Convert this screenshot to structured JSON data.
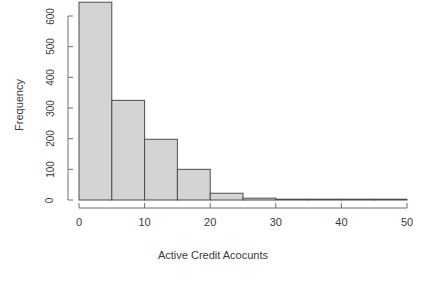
{
  "chart_data": {
    "type": "bar",
    "title": "",
    "xlabel": "Active Credit Acocunts",
    "ylabel": "Frequency",
    "bin_width": 5,
    "categories": [
      "0-5",
      "5-10",
      "10-15",
      "15-20",
      "20-25",
      "25-30",
      "30-35",
      "35-40",
      "40-45",
      "45-50"
    ],
    "bin_starts": [
      0,
      5,
      10,
      15,
      20,
      25,
      30,
      35,
      40,
      45
    ],
    "bin_ends": [
      5,
      10,
      15,
      20,
      25,
      30,
      35,
      40,
      45,
      50
    ],
    "values": [
      645,
      325,
      198,
      100,
      22,
      6,
      2,
      1,
      0,
      0
    ],
    "xlim": [
      0,
      50
    ],
    "ylim": [
      0,
      650
    ],
    "xticks": [
      0,
      10,
      20,
      30,
      40,
      50
    ],
    "xtick_labels": [
      "0",
      "10",
      "20",
      "30",
      "40",
      "50"
    ],
    "yticks": [
      0,
      100,
      200,
      300,
      400,
      500,
      600
    ],
    "ytick_labels": [
      "0",
      "100",
      "200",
      "300",
      "400",
      "500",
      "600"
    ],
    "grid": false,
    "legend": "none",
    "bar_fill_color": "#d4d4d4",
    "bar_border_color": "#4d4d4d",
    "axis_color": "#6e6e6e",
    "text_color": "#3a3a3a",
    "background_color": "#ffffff"
  }
}
